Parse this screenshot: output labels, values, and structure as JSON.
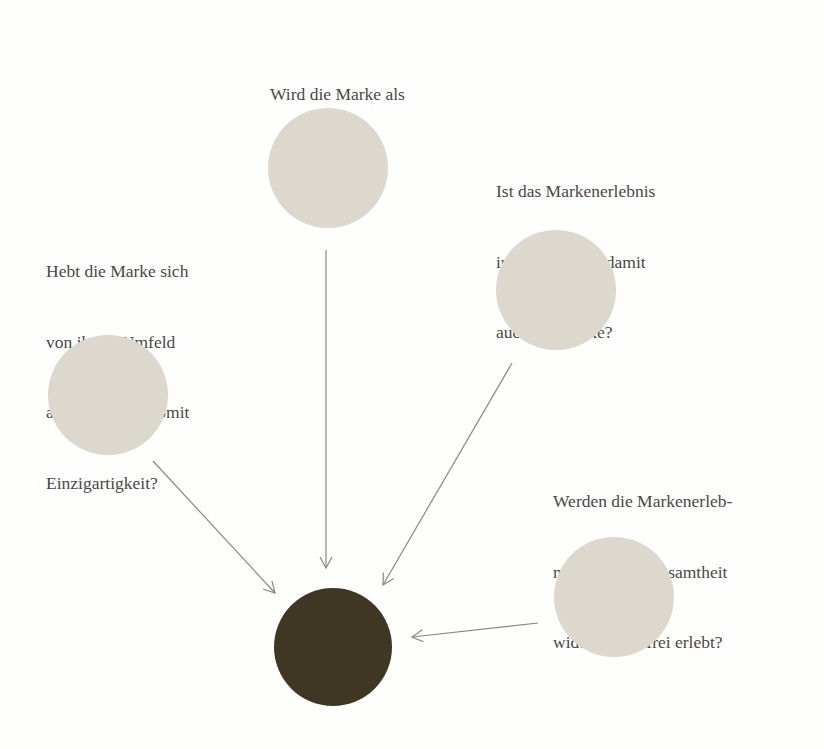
{
  "diagram": {
    "type": "convergence",
    "colors": {
      "background": "#fefefc",
      "input_circle": "#dcd8cd",
      "target_circle": "#3f3624",
      "arrow": "#8a8782",
      "text": "#4a4744"
    },
    "nodes": [
      {
        "id": "nuetzlichkeit",
        "label_lines": [
          "Wird die Marke als",
          "nützlich erlebt?"
        ],
        "label_pos": {
          "x": 270,
          "y": 36
        },
        "circle": {
          "cx": 328,
          "cy": 168,
          "r": 60
        }
      },
      {
        "id": "interesse",
        "label_lines": [
          "Ist das Markenerlebnis",
          "interessant und damit",
          "auch die Marke?"
        ],
        "label_pos": {
          "x": 496,
          "y": 133
        },
        "circle": {
          "cx": 556,
          "cy": 290,
          "r": 60
        }
      },
      {
        "id": "einzigartigkeit",
        "label_lines": [
          "Hebt die Marke sich",
          "von ihrem Umfeld",
          "ab und erlangt somit",
          "Einzigartigkeit?"
        ],
        "label_pos": {
          "x": 46,
          "y": 213
        },
        "circle": {
          "cx": 108,
          "cy": 395,
          "r": 60
        }
      },
      {
        "id": "widerspruchsfreiheit",
        "label_lines": [
          "Werden die Markenerleb-",
          "nisse in ihrer Gesamtheit",
          "widerspruchsfrei erlebt?"
        ],
        "label_pos": {
          "x": 553,
          "y": 443
        },
        "circle": {
          "cx": 614,
          "cy": 597,
          "r": 60
        }
      }
    ],
    "target": {
      "id": "marke",
      "circle": {
        "cx": 333,
        "cy": 647,
        "r": 59
      }
    },
    "arrows": [
      {
        "from": "einzigartigkeit",
        "x1": 153,
        "y1": 461,
        "x2": 275,
        "y2": 593
      },
      {
        "from": "nuetzlichkeit",
        "x1": 326,
        "y1": 250,
        "x2": 326,
        "y2": 568
      },
      {
        "from": "interesse",
        "x1": 512,
        "y1": 363,
        "x2": 383,
        "y2": 585
      },
      {
        "from": "widerspruchsfreiheit",
        "x1": 538,
        "y1": 623,
        "x2": 412,
        "y2": 637
      }
    ]
  }
}
